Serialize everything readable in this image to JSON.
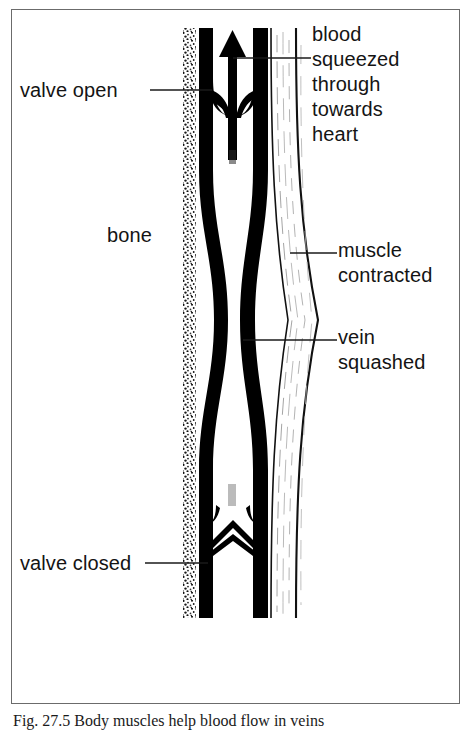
{
  "figure": {
    "caption": "Fig. 27.5  Body muscles help blood flow in veins",
    "border_color": "#6b6b6b",
    "ink_color": "#000000",
    "background": "#ffffff"
  },
  "labels": {
    "valve_open": "valve open",
    "bone": "bone",
    "valve_closed": "valve closed",
    "blood": "blood\nsqueezed\nthrough\ntowards\nheart",
    "muscle": "muscle\ncontracted",
    "vein": "vein\nsquashed"
  },
  "diagram": {
    "type": "biology-schematic",
    "parts": [
      {
        "name": "bone",
        "style": "stippled vertical band",
        "x_range": [
          183,
          196
        ],
        "y_range": [
          28,
          618
        ]
      },
      {
        "name": "vein-wall-left",
        "style": "thick black vertical band",
        "x_range": [
          198,
          213
        ],
        "y_range": [
          28,
          618
        ]
      },
      {
        "name": "vein-lumen",
        "style": "white channel between vein walls",
        "x_range": [
          213,
          252
        ],
        "y_range": [
          28,
          618
        ]
      },
      {
        "name": "vein-wall-right",
        "style": "thick black vertical band",
        "x_range": [
          252,
          268
        ],
        "y_range": [
          28,
          618
        ]
      },
      {
        "name": "muscle-contracted",
        "style": "spindle-shaped bulge with fibre lines",
        "x_range": [
          270,
          320
        ],
        "y_range": [
          28,
          618
        ]
      },
      {
        "name": "blood-flow-arrow",
        "style": "upward solid arrow in lumen",
        "x_range": [
          226,
          240
        ],
        "y_range": [
          32,
          160
        ]
      },
      {
        "name": "valve-open",
        "style": "two cusps folded back against vein walls",
        "y": 95
      },
      {
        "name": "valve-closed",
        "style": "two cusps meeting in a peak across lumen",
        "y": 540
      }
    ],
    "leader_lines": [
      {
        "from": "valve open",
        "to_x": 212,
        "y": 90
      },
      {
        "from": "blood squeezed through towards heart",
        "to_x": 233,
        "y": 58
      },
      {
        "from": "muscle contracted",
        "to_x": 290,
        "y": 253
      },
      {
        "from": "vein squashed",
        "to_x": 243,
        "y": 340
      },
      {
        "from": "valve closed",
        "to_x": 208,
        "y": 563
      }
    ]
  }
}
